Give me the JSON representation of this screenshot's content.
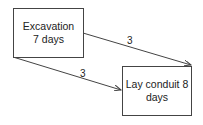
{
  "diagram": {
    "nodes": [
      {
        "id": "excavation",
        "line1": "Excavation",
        "line2": "7 days"
      },
      {
        "id": "lay-conduit",
        "line1": "Lay conduit 8",
        "line2": "days"
      }
    ],
    "edges": [
      {
        "from": "excavation",
        "to": "lay-conduit",
        "label": "3",
        "position": "upper"
      },
      {
        "from": "excavation",
        "to": "lay-conduit",
        "label": "3",
        "position": "lower"
      }
    ],
    "colors": {
      "stroke": "#444444",
      "text": "#222222",
      "background": "#ffffff"
    }
  }
}
